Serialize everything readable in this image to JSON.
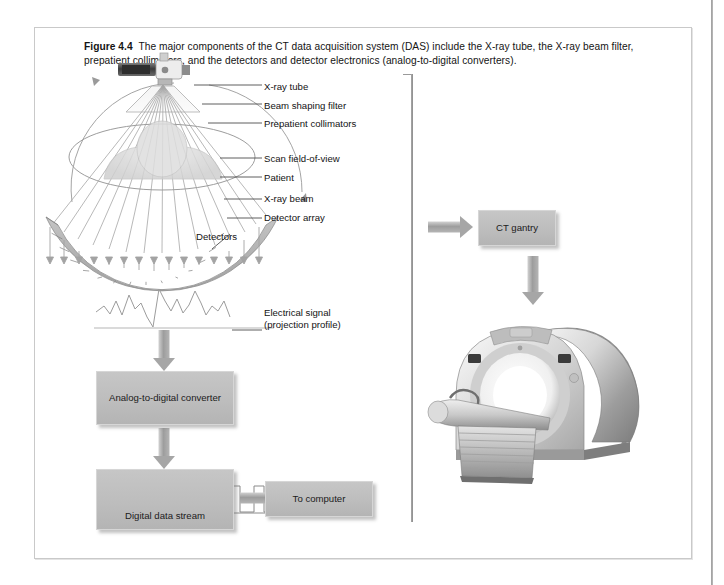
{
  "figure": {
    "number_label": "Figure 4.4",
    "caption": "The major components of the CT data acquisition system (DAS) include the X-ray tube, the X-ray beam filter, prepatient collimators, and the detectors and detector electronics (analog-to-digital converters)."
  },
  "callouts": [
    {
      "id": "xray-tube",
      "text": "X-ray tube"
    },
    {
      "id": "beam-shaping-filter",
      "text": "Beam shaping filter"
    },
    {
      "id": "prepatient-collimators",
      "text": "Prepatient collimators"
    },
    {
      "id": "scan-field-of-view",
      "text": "Scan field-of-view"
    },
    {
      "id": "patient",
      "text": "Patient"
    },
    {
      "id": "xray-beam",
      "text": "X-ray beam"
    },
    {
      "id": "detector-array",
      "text": "Detector array"
    },
    {
      "id": "detectors",
      "text": "Detectors"
    },
    {
      "id": "electrical-signal",
      "text": "Electrical signal\n(projection profile)"
    }
  ],
  "process_boxes": [
    {
      "id": "analog-to-digital-converter",
      "text": "Analog-to-digital\nconverter"
    },
    {
      "id": "digital-data-stream",
      "text": "Digital data stream"
    },
    {
      "id": "to-computer",
      "text": "To computer"
    },
    {
      "id": "ct-gantry",
      "text": "CT gantry"
    }
  ],
  "colors": {
    "box_fill": "#bdbdbd",
    "box_border": "#d6d6d6",
    "arrow": "#a6a6a6",
    "detector_fill": "#b0b0b0",
    "frame_border": "#c9c9c9",
    "text": "#141414"
  },
  "graphics": {
    "detector_segments": 17,
    "beam_rays": 13,
    "detector_arrows": 15,
    "digital_pulses": 7
  }
}
